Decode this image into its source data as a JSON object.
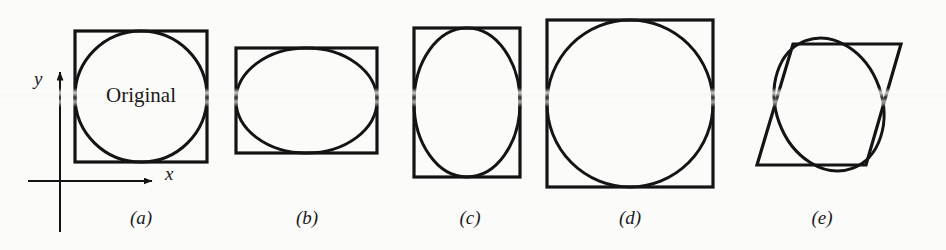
{
  "figure": {
    "width": 946,
    "height": 250,
    "background_color": "#fbfbfa",
    "stroke_color": "#141414",
    "text_color": "#1a1a1a",
    "axes": {
      "y_label": "y",
      "x_label": "x",
      "y_label_pos": {
        "x": 36,
        "y": 78
      },
      "x_label_pos": {
        "x": 167,
        "y": 172
      },
      "origin": {
        "x": 60,
        "y": 181
      },
      "x_axis": {
        "x1": 28,
        "y1": 181,
        "x2": 158,
        "y2": 181
      },
      "y_axis": {
        "x1": 60,
        "y1": 232,
        "x2": 60,
        "y2": 66
      }
    },
    "panels": [
      {
        "id": "a",
        "caption": "(a)",
        "caption_pos": {
          "x": 141,
          "y": 210
        },
        "outline_type": "square",
        "outline": {
          "x": 75,
          "y": 31,
          "w": 132,
          "h": 131
        },
        "inner_type": "circle",
        "inner": {
          "cx": 141,
          "cy": 96.5,
          "rx": 66,
          "ry": 65.5
        },
        "label": "Original",
        "label_pos": {
          "x": 141,
          "y": 95
        }
      },
      {
        "id": "b",
        "caption": "(b)",
        "caption_pos": {
          "x": 307,
          "y": 210
        },
        "outline_type": "rect",
        "outline": {
          "x": 236,
          "y": 48,
          "w": 141,
          "h": 105
        },
        "inner_type": "ellipse",
        "inner": {
          "cx": 306.5,
          "cy": 100.5,
          "rx": 70.5,
          "ry": 52.5
        },
        "label": "",
        "label_pos": null
      },
      {
        "id": "c",
        "caption": "(c)",
        "caption_pos": {
          "x": 470,
          "y": 210
        },
        "outline_type": "rect",
        "outline": {
          "x": 414,
          "y": 28,
          "w": 106,
          "h": 149
        },
        "inner_type": "ellipse",
        "inner": {
          "cx": 467,
          "cy": 102.5,
          "rx": 53,
          "ry": 74.5
        },
        "label": "",
        "label_pos": null
      },
      {
        "id": "d",
        "caption": "(d)",
        "caption_pos": {
          "x": 630,
          "y": 210
        },
        "outline_type": "square",
        "outline": {
          "x": 547,
          "y": 20,
          "w": 166,
          "h": 167
        },
        "inner_type": "circle",
        "inner": {
          "cx": 630,
          "cy": 103.5,
          "rx": 83,
          "ry": 83.5
        },
        "label": "",
        "label_pos": null
      },
      {
        "id": "e",
        "caption": "(e)",
        "caption_pos": {
          "x": 822,
          "y": 210
        },
        "outline_type": "parallelogram",
        "outline_points": "793,44 901,44 866,165 757,165",
        "inner_type": "rotated-ellipse",
        "inner": {
          "cx": 829,
          "cy": 104.5,
          "rx": 53,
          "ry": 68,
          "rotation": -20
        },
        "label": "",
        "label_pos": null
      }
    ],
    "stroke_widths": {
      "outline": 3.2,
      "inner": 3.0,
      "axis": 2.0
    },
    "scan_streaks": [
      {
        "y": 92,
        "opacity": 0.55
      },
      {
        "y": 101,
        "opacity": 0.45
      }
    ]
  }
}
